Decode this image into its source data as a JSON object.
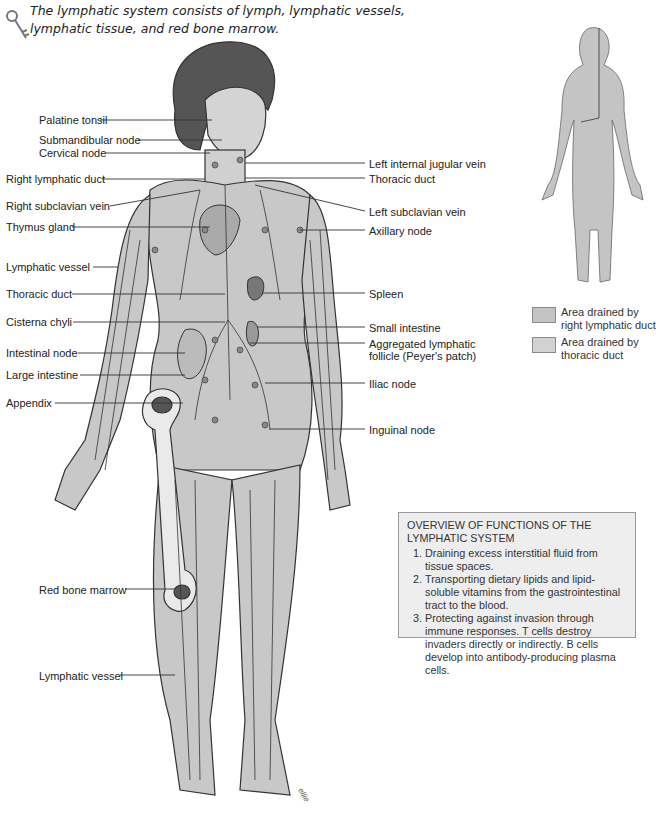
{
  "caption": "The lymphatic system consists of lymph, lymphatic vessels, lymphatic tissue, and red bone marrow.",
  "caption_icon": "key-icon",
  "labels_left": [
    {
      "text": "Palatine tonsil",
      "x": 24,
      "y": 114
    },
    {
      "text": "Submandibular node",
      "x": 39,
      "y": 134
    },
    {
      "text": "Cervical node",
      "x": 39,
      "y": 147
    },
    {
      "text": "Right lymphatic duct",
      "x": 6,
      "y": 173
    },
    {
      "text": "Right subclavian vein",
      "x": 6,
      "y": 200
    },
    {
      "text": "Thymus gland",
      "x": 6,
      "y": 221
    },
    {
      "text": "Lymphatic vessel",
      "x": 6,
      "y": 261
    },
    {
      "text": "Thoracic duct",
      "x": 6,
      "y": 288
    },
    {
      "text": "Cisterna chyli",
      "x": 6,
      "y": 316
    },
    {
      "text": "Intestinal node",
      "x": 6,
      "y": 347
    },
    {
      "text": "Large intestine",
      "x": 6,
      "y": 369
    },
    {
      "text": "Appendix",
      "x": 6,
      "y": 397
    },
    {
      "text": "Red bone marrow",
      "x": 39,
      "y": 584
    },
    {
      "text": "Lymphatic vessel",
      "x": 39,
      "y": 670
    }
  ],
  "labels_right": [
    {
      "text": "Left internal jugular vein",
      "x": 369,
      "y": 158
    },
    {
      "text": "Thoracic duct",
      "x": 369,
      "y": 173
    },
    {
      "text": "Left subclavian vein",
      "x": 369,
      "y": 206
    },
    {
      "text": "Axillary node",
      "x": 369,
      "y": 225
    },
    {
      "text": "Spleen",
      "x": 369,
      "y": 288
    },
    {
      "text": "Small intestine",
      "x": 369,
      "y": 322
    },
    {
      "text": "Aggregated lymphatic",
      "x": 369,
      "y": 338
    },
    {
      "text": "follicle (Peyer's patch)",
      "x": 369,
      "y": 350
    },
    {
      "text": "Iliac node",
      "x": 369,
      "y": 378
    },
    {
      "text": "Inguinal node",
      "x": 369,
      "y": 424
    }
  ],
  "legend": [
    {
      "text_1": "Area drained by",
      "text_2": "right lymphatic duct",
      "color": "#c4c4c4"
    },
    {
      "text_1": "Area drained by",
      "text_2": "thoracic duct",
      "color": "#d2d2d2"
    }
  ],
  "overview": {
    "title_1": "OVERVIEW OF FUNCTIONS OF THE",
    "title_2": "LYMPHATIC SYSTEM",
    "items": [
      "Draining excess interstitial fluid from tissue spaces.",
      "Transporting dietary lipids and lipid-soluble vitamins from the gastrointestinal tract to the blood.",
      "Protecting against invasion through immune responses. T cells destroy invaders directly or indirectly. B cells develop into antibody-producing plasma cells."
    ]
  },
  "colors": {
    "body_fill": "#c8c8c8",
    "line": "#333333",
    "box_fill": "#eeeeee",
    "box_border": "#9a9a9a"
  },
  "signature": "ellie"
}
